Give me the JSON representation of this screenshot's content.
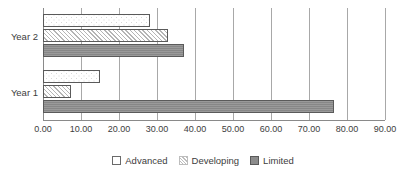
{
  "chart_data": {
    "type": "bar",
    "orientation": "horizontal",
    "title": "",
    "xlabel": "",
    "ylabel": "",
    "categories": [
      "Year 1",
      "Year 2"
    ],
    "series": [
      {
        "name": "Advanced",
        "values": [
          15.0,
          28.2
        ]
      },
      {
        "name": "Developing",
        "values": [
          7.3,
          33.0
        ]
      },
      {
        "name": "Limited",
        "values": [
          76.5,
          37.0
        ]
      }
    ],
    "xlim": [
      0,
      90
    ],
    "xticks": [
      0,
      10,
      20,
      30,
      40,
      50,
      60,
      70,
      80,
      90
    ],
    "xtick_labels": [
      "0.00",
      "10.00",
      "20.00",
      "30.00",
      "40.00",
      "50.00",
      "60.00",
      "70.00",
      "80.00",
      "90.00"
    ],
    "grid": true,
    "grid_axis": "x",
    "legend_position": "bottom"
  },
  "axis": {
    "tick_labels": [
      "0.00",
      "10.00",
      "20.00",
      "30.00",
      "40.00",
      "50.00",
      "60.00",
      "70.00",
      "80.00",
      "90.00"
    ]
  },
  "categories": {
    "year2_label": "Year 2",
    "year1_label": "Year 1"
  },
  "legend": {
    "items": [
      {
        "label": "Advanced",
        "color": "#ffffff",
        "pattern": "dotted"
      },
      {
        "label": "Developing",
        "color": "#fafafa",
        "pattern": "diagonal-hatch"
      },
      {
        "label": "Limited",
        "color": "#8c8c8c",
        "pattern": "solid"
      }
    ]
  },
  "colors": {
    "advanced": "#ffffff",
    "developing": "#fafafa",
    "limited": "#8c8c8c",
    "gridline": "#a8a8a8",
    "text": "#3d3d3d",
    "background": "#ffffff"
  },
  "bars": {
    "year2_advanced": {
      "value": 28.2,
      "label": "Advanced"
    },
    "year2_developing": {
      "value": 33.0,
      "label": "Developing"
    },
    "year2_limited": {
      "value": 37.0,
      "label": "Limited"
    },
    "year1_advanced": {
      "value": 15.0,
      "label": "Advanced"
    },
    "year1_developing": {
      "value": 7.3,
      "label": "Developing"
    },
    "year1_limited": {
      "value": 76.5,
      "label": "Limited"
    }
  }
}
